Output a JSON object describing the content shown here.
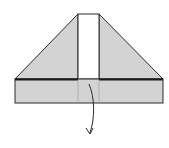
{
  "diagram": {
    "type": "origami-fold-step",
    "colors": {
      "paper_fill": "#d3d3d3",
      "strip_fill": "#ffffff",
      "stroke": "#2a2a2a",
      "background": "#ffffff"
    },
    "shapes": {
      "trapezoid_left": "15,79 78,14 78,79",
      "trapezoid_right": "99,14 163,79 99,79",
      "white_strip": {
        "x": 78,
        "y": 14,
        "w": 21,
        "h": 65
      },
      "bottom_band": {
        "x": 15,
        "y": 79,
        "w": 148,
        "h": 24
      }
    },
    "arrow": {
      "direction": "down",
      "meaning": "fold-down"
    }
  }
}
